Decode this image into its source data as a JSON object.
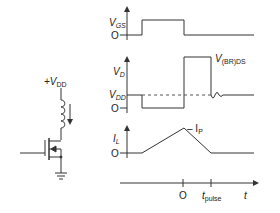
{
  "circuit": {
    "supply_label": "+V",
    "supply_sub": "DD"
  },
  "waveforms": {
    "vgs": {
      "label": "V",
      "sub": "GS",
      "zero": "O"
    },
    "vd": {
      "label": "V",
      "sub": "D",
      "vdd_label": "V",
      "vdd_sub": "DD",
      "zero": "O",
      "breakdown_label": "V",
      "breakdown_sub": "(BR)DS"
    },
    "il": {
      "label": "I",
      "sub": "L",
      "zero": "O",
      "peak_label": "– I",
      "peak_sub": "P"
    },
    "time": {
      "origin": "O",
      "pulse_label": "t",
      "pulse_sub": "pulse",
      "axis_label": "t"
    }
  },
  "colors": {
    "line": "#333333",
    "dashed": "#555555"
  }
}
